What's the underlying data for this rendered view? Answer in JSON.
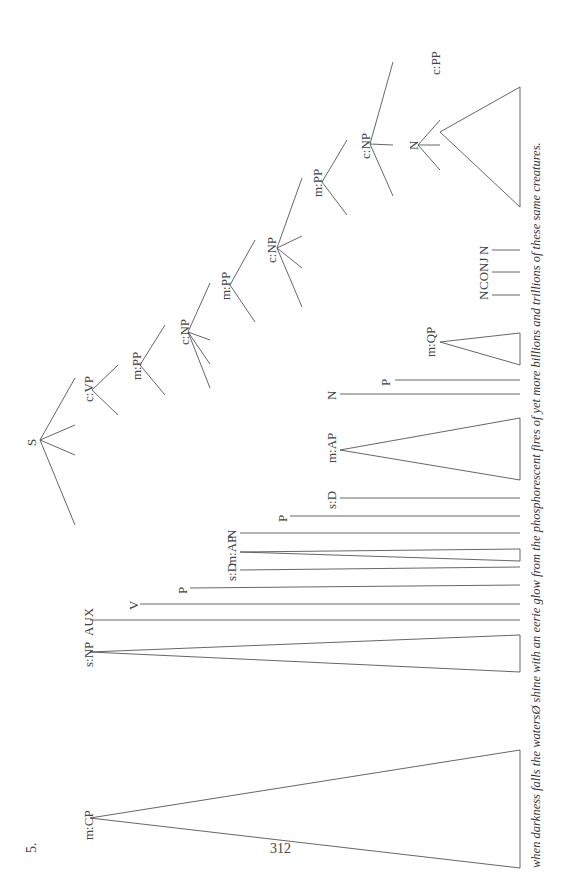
{
  "example_number": "5.",
  "page_number": "312",
  "sentence": "when darkness falls the watersØ shine with an eerie glow from the phosphorescent fires of yet more billions and trillions of these same creatures.",
  "tree": {
    "label": "S",
    "children": [
      {
        "label": "m:CP",
        "triangle": true,
        "yield": "when darkness falls"
      },
      {
        "label": "s:NP",
        "triangle": true,
        "yield": "the watersØ"
      },
      {
        "label": "AUX",
        "yield": "Ø"
      },
      {
        "label": "c:VP",
        "children": [
          {
            "label": "V",
            "yield": "shine"
          },
          {
            "label": "m:PP",
            "children": [
              {
                "label": "P",
                "yield": "with"
              },
              {
                "label": "c:NP",
                "children": [
                  {
                    "label": "s:D",
                    "yield": "an"
                  },
                  {
                    "label": "m:AP",
                    "triangle": true,
                    "yield": "eerie"
                  },
                  {
                    "label": "N",
                    "yield": "glow"
                  },
                  {
                    "label": "m:PP",
                    "children": [
                      {
                        "label": "P",
                        "yield": "from"
                      },
                      {
                        "label": "c:NP",
                        "children": [
                          {
                            "label": "s:D",
                            "yield": "the"
                          },
                          {
                            "label": "m:AP",
                            "triangle": true,
                            "yield": "phosphorescent"
                          },
                          {
                            "label": "N",
                            "yield": "fires"
                          },
                          {
                            "label": "m:PP",
                            "children": [
                              {
                                "label": "P",
                                "yield": "of"
                              },
                              {
                                "label": "c:NP",
                                "children": [
                                  {
                                    "label": "m:QP",
                                    "triangle": true,
                                    "yield": "yet more"
                                  },
                                  {
                                    "label": "N",
                                    "children": [
                                      {
                                        "label": "N",
                                        "yield": "billions"
                                      },
                                      {
                                        "label": "CONJ",
                                        "yield": "and"
                                      },
                                      {
                                        "label": "N",
                                        "yield": "trillions"
                                      }
                                    ]
                                  },
                                  {
                                    "label": "c:PP",
                                    "triangle": true,
                                    "yield": "of these same creatures"
                                  }
                                ]
                              }
                            ]
                          }
                        ]
                      }
                    ]
                  }
                ]
              }
            ]
          }
        ]
      }
    ]
  },
  "labels": {
    "S": "S",
    "mCP": "m:CP",
    "sNP": "s:NP",
    "AUX": "AUX",
    "cVP": "c:VP",
    "V": "V",
    "mPP1": "m:PP",
    "P1": "P",
    "cNP1": "c:NP",
    "sD1": "s:D",
    "mAP1": "m:AP",
    "N1": "N",
    "mPP2": "m:PP",
    "P2": "P",
    "cNP2": "c:NP",
    "sD2": "s:D",
    "mAP2": "m:AP",
    "N2": "N",
    "mPP3": "m:PP",
    "P3": "P",
    "cNP3": "c:NP",
    "mQP": "m:QP",
    "N3": "N",
    "N4": "N",
    "CONJ": "CONJ",
    "N5": "N",
    "cPP": "c:PP"
  },
  "colors": {
    "ink": "#444444",
    "background": "#ffffff"
  }
}
